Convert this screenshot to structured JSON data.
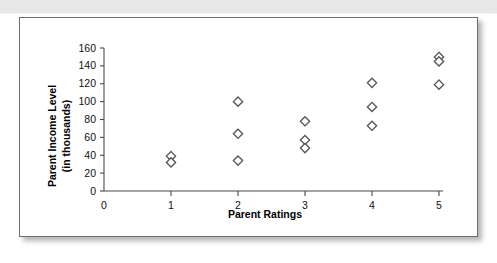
{
  "figure": {
    "panel_border_color": "#6e6e6e",
    "background_color": "#ffffff",
    "top_band_color": "#e8e8e8"
  },
  "chart_data": {
    "type": "scatter",
    "title": "",
    "xlabel": "Parent Ratings",
    "ylabel_line1": "Parent Income Level",
    "ylabel_line2": "(in thousands)",
    "xlim": [
      0,
      5
    ],
    "ylim": [
      0,
      160
    ],
    "xticks": [
      0,
      1,
      2,
      3,
      4,
      5
    ],
    "xtick_labels": [
      "0",
      "1",
      "2",
      "3",
      "4",
      "5"
    ],
    "yticks": [
      0,
      20,
      40,
      60,
      80,
      100,
      120,
      140,
      160
    ],
    "ytick_labels": [
      "0",
      "20",
      "40",
      "60",
      "80",
      "100",
      "120",
      "140",
      "160"
    ],
    "grid": false,
    "legend": null,
    "marker_shape": "diamond",
    "marker_fill": "#ffffff",
    "marker_edge": "#555555",
    "points": [
      {
        "x": 1,
        "y": 39
      },
      {
        "x": 1,
        "y": 32
      },
      {
        "x": 2,
        "y": 100
      },
      {
        "x": 2,
        "y": 64
      },
      {
        "x": 2,
        "y": 34
      },
      {
        "x": 3,
        "y": 78
      },
      {
        "x": 3,
        "y": 57
      },
      {
        "x": 3,
        "y": 48
      },
      {
        "x": 4,
        "y": 121
      },
      {
        "x": 4,
        "y": 94
      },
      {
        "x": 4,
        "y": 73
      },
      {
        "x": 5,
        "y": 150
      },
      {
        "x": 5,
        "y": 145
      },
      {
        "x": 5,
        "y": 119
      }
    ]
  }
}
